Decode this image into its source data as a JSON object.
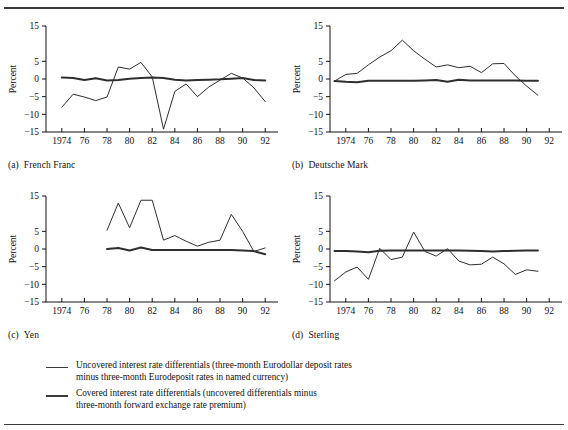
{
  "figure": {
    "rules": {
      "top": "horizontal-rule",
      "bottom": "horizontal-rule"
    },
    "panel_captions": [
      {
        "tag": "(a)",
        "label": "French Franc"
      },
      {
        "tag": "(b)",
        "label": "Deutsche Mark"
      },
      {
        "tag": "(c)",
        "label": "Yen"
      },
      {
        "tag": "(d)",
        "label": "Sterling"
      }
    ]
  },
  "legend": {
    "entries": [
      {
        "style": "thin",
        "lines": [
          "Uncovered interest rate differentials (three-month Eurodollar deposit rates",
          "minus three-month Eurodeposit rates in named currency)"
        ]
      },
      {
        "style": "thick",
        "lines": [
          "Covered interest rate differentials (uncovered differentials minus",
          "three-month forward exchange rate premium)"
        ]
      }
    ]
  },
  "chart_data": [
    {
      "type": "line",
      "panel": "a",
      "title": "French Franc",
      "xlabel": "",
      "ylabel": "Percent",
      "xlim": [
        1972.6,
        1992.6
      ],
      "ylim": [
        -15,
        15
      ],
      "yticks": [
        15,
        5,
        0,
        -5,
        -10,
        -15
      ],
      "ytick_labels": [
        "15",
        "5",
        "0",
        "−5",
        "−10",
        "−15"
      ],
      "xticks": [
        1974,
        1976,
        1978,
        1980,
        1982,
        1984,
        1986,
        1988,
        1990,
        1992
      ],
      "xtick_labels": [
        "1974",
        "76",
        "78",
        "80",
        "82",
        "84",
        "86",
        "88",
        "90",
        "92"
      ],
      "grid": false,
      "legend_position": "below-figure",
      "series": [
        {
          "name": "Uncovered interest rate differentials",
          "style": "thin",
          "x": [
            1974,
            1975,
            1976,
            1977,
            1978,
            1979,
            1980,
            1981,
            1982,
            1983,
            1984,
            1985,
            1986,
            1987,
            1988,
            1989,
            1990,
            1991,
            1992
          ],
          "values": [
            -8.0,
            -4.3,
            -5.1,
            -6.1,
            -5.1,
            3.4,
            2.8,
            4.7,
            0.6,
            -14.2,
            -3.5,
            -1.4,
            -5.0,
            -2.3,
            -0.3,
            1.6,
            0.3,
            -2.5,
            -6.4
          ]
        },
        {
          "name": "Covered interest rate differentials",
          "style": "thick",
          "x": [
            1974,
            1975,
            1976,
            1977,
            1978,
            1979,
            1980,
            1981,
            1982,
            1983,
            1984,
            1985,
            1986,
            1987,
            1988,
            1989,
            1990,
            1991,
            1992
          ],
          "values": [
            0.4,
            0.3,
            -0.3,
            0.2,
            -0.4,
            -0.3,
            0.1,
            0.3,
            0.4,
            0.3,
            -0.2,
            -0.4,
            -0.3,
            -0.2,
            -0.1,
            0.1,
            0.3,
            -0.3,
            -0.4
          ]
        }
      ]
    },
    {
      "type": "line",
      "panel": "b",
      "title": "Deutsche Mark",
      "xlabel": "",
      "ylabel": "Percent",
      "xlim": [
        1972.6,
        1992.6
      ],
      "ylim": [
        -15,
        15
      ],
      "yticks": [
        15,
        5,
        0,
        -5,
        -10,
        -15
      ],
      "ytick_labels": [
        "15",
        "5",
        "0",
        "−5",
        "−10",
        "−15"
      ],
      "xticks": [
        1974,
        1976,
        1978,
        1980,
        1982,
        1984,
        1986,
        1988,
        1990,
        1992
      ],
      "xtick_labels": [
        "1974",
        "76",
        "78",
        "80",
        "82",
        "84",
        "86",
        "88",
        "90",
        "92"
      ],
      "grid": false,
      "legend_position": "below-figure",
      "series": [
        {
          "name": "Uncovered interest rate differentials",
          "style": "thin",
          "x": [
            1973,
            1974,
            1975,
            1976,
            1977,
            1978,
            1979,
            1980,
            1981,
            1982,
            1983,
            1984,
            1985,
            1986,
            1987,
            1988,
            1989,
            1990,
            1991
          ],
          "values": [
            -0.6,
            1.3,
            1.6,
            4.0,
            6.2,
            8.0,
            11.0,
            8.0,
            5.6,
            3.4,
            4.0,
            3.2,
            3.6,
            1.8,
            4.3,
            4.4,
            0.9,
            -2.0,
            -4.6
          ]
        },
        {
          "name": "Covered interest rate differentials",
          "style": "thick",
          "x": [
            1973,
            1974,
            1975,
            1976,
            1977,
            1978,
            1979,
            1980,
            1981,
            1982,
            1983,
            1984,
            1985,
            1986,
            1987,
            1988,
            1989,
            1990,
            1991
          ],
          "values": [
            -0.6,
            -0.8,
            -0.9,
            -0.5,
            -0.5,
            -0.5,
            -0.5,
            -0.5,
            -0.4,
            -0.3,
            -0.8,
            -0.2,
            -0.4,
            -0.4,
            -0.4,
            -0.4,
            -0.4,
            -0.5,
            -0.5
          ]
        }
      ]
    },
    {
      "type": "line",
      "panel": "c",
      "title": "Yen",
      "xlabel": "",
      "ylabel": "Percent",
      "xlim": [
        1972.6,
        1992.6
      ],
      "ylim": [
        -15,
        15
      ],
      "yticks": [
        15,
        5,
        0,
        -5,
        -10,
        -15
      ],
      "ytick_labels": [
        "15",
        "5",
        "0",
        "−5",
        "−10",
        "−15"
      ],
      "xticks": [
        1974,
        1976,
        1978,
        1980,
        1982,
        1984,
        1986,
        1988,
        1990,
        1992
      ],
      "xtick_labels": [
        "1974",
        "76",
        "78",
        "80",
        "82",
        "84",
        "86",
        "88",
        "90",
        "92"
      ],
      "grid": false,
      "legend_position": "below-figure",
      "series": [
        {
          "name": "Uncovered interest rate differentials",
          "style": "thin",
          "x": [
            1978,
            1979,
            1980,
            1981,
            1982,
            1983,
            1984,
            1985,
            1986,
            1987,
            1988,
            1989,
            1990,
            1991,
            1992
          ],
          "values": [
            5.3,
            13.0,
            6.0,
            13.8,
            13.8,
            2.5,
            3.8,
            2.2,
            0.8,
            1.9,
            2.5,
            9.8,
            5.0,
            -0.7,
            0.3
          ]
        },
        {
          "name": "Covered interest rate differentials",
          "style": "thick",
          "x": [
            1978,
            1979,
            1980,
            1981,
            1982,
            1983,
            1984,
            1985,
            1986,
            1987,
            1988,
            1989,
            1990,
            1991,
            1992
          ],
          "values": [
            0.0,
            0.3,
            -0.4,
            0.4,
            -0.3,
            -0.3,
            -0.3,
            -0.3,
            -0.3,
            -0.3,
            -0.3,
            -0.3,
            -0.4,
            -0.6,
            -1.5
          ]
        }
      ]
    },
    {
      "type": "line",
      "panel": "d",
      "title": "Sterling",
      "xlabel": "",
      "ylabel": "Percent",
      "xlim": [
        1972.6,
        1992.6
      ],
      "ylim": [
        -15,
        15
      ],
      "yticks": [
        15,
        5,
        0,
        -5,
        -10,
        -15
      ],
      "ytick_labels": [
        "15",
        "5",
        "0",
        "−5",
        "−10",
        "−15"
      ],
      "xticks": [
        1974,
        1976,
        1978,
        1980,
        1982,
        1984,
        1986,
        1988,
        1990,
        1992
      ],
      "xtick_labels": [
        "1974",
        "76",
        "78",
        "80",
        "82",
        "84",
        "86",
        "88",
        "90",
        "92"
      ],
      "grid": false,
      "legend_position": "below-figure",
      "series": [
        {
          "name": "Uncovered interest rate differentials",
          "style": "thin",
          "x": [
            1973,
            1974,
            1975,
            1976,
            1977,
            1978,
            1979,
            1980,
            1981,
            1982,
            1983,
            1984,
            1985,
            1986,
            1987,
            1988,
            1989,
            1990,
            1991
          ],
          "values": [
            -9.0,
            -6.5,
            -5.1,
            -8.6,
            0.2,
            -3.0,
            -2.3,
            4.8,
            -0.7,
            -2.0,
            0.1,
            -3.4,
            -4.5,
            -4.3,
            -2.3,
            -4.2,
            -7.2,
            -5.9,
            -6.3
          ]
        },
        {
          "name": "Covered interest rate differentials",
          "style": "thick",
          "x": [
            1973,
            1974,
            1975,
            1976,
            1977,
            1978,
            1979,
            1980,
            1981,
            1982,
            1983,
            1984,
            1985,
            1986,
            1987,
            1988,
            1989,
            1990,
            1991
          ],
          "values": [
            -0.6,
            -0.6,
            -0.7,
            -0.9,
            -0.5,
            -0.4,
            -0.4,
            -0.4,
            -0.4,
            -0.4,
            -0.4,
            -0.4,
            -0.5,
            -0.6,
            -0.7,
            -0.6,
            -0.5,
            -0.4,
            -0.4
          ]
        }
      ]
    }
  ]
}
